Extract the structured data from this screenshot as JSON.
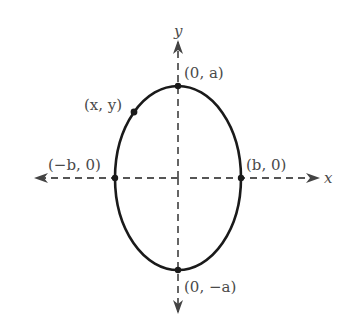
{
  "figure": {
    "type": "ellipse-diagram",
    "colors": {
      "curve": "#1a1a1a",
      "axis": "#555555",
      "text": "#4a4a4a",
      "background": "#ffffff"
    },
    "axes": {
      "x_label": "x",
      "y_label": "y",
      "style": "dashed with arrowheads"
    },
    "ellipse": {
      "center": [
        0,
        0
      ],
      "orientation": "vertical major axis",
      "semi_major": "a",
      "semi_minor": "b"
    },
    "points": [
      {
        "id": "top-vertex",
        "label": "(0, a)"
      },
      {
        "id": "bottom-vertex",
        "label": "(0, −a)"
      },
      {
        "id": "left-vertex",
        "label": "(−b, 0)"
      },
      {
        "id": "right-vertex",
        "label": "(b, 0)"
      },
      {
        "id": "general-point",
        "label": "(x, y)"
      }
    ]
  }
}
